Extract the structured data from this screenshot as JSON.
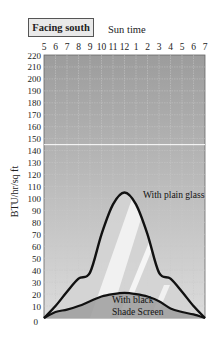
{
  "chart_data": {
    "type": "line",
    "title": "Facing south",
    "xlabel": "Sun time",
    "ylabel": "BTU/hr/sq ft",
    "x_ticks": [
      "5",
      "6",
      "7",
      "8",
      "9",
      "10",
      "11",
      "12",
      "1",
      "2",
      "3",
      "4",
      "5",
      "6",
      "7"
    ],
    "y_ticks": [
      0,
      10,
      20,
      30,
      40,
      50,
      60,
      70,
      80,
      90,
      100,
      110,
      120,
      130,
      140,
      150,
      160,
      170,
      180,
      190,
      200,
      210,
      220
    ],
    "ylim": [
      0,
      220
    ],
    "grid": true,
    "reference_line": {
      "y": 145,
      "color": "#ffffff"
    },
    "x": [
      "5",
      "6",
      "7",
      "8",
      "9",
      "10",
      "11",
      "12",
      "1",
      "2",
      "3",
      "4",
      "5",
      "6",
      "7"
    ],
    "series": [
      {
        "name": "With plain glass",
        "values": [
          0,
          10,
          22,
          33,
          38,
          70,
          95,
          105,
          95,
          70,
          38,
          33,
          22,
          10,
          0
        ]
      },
      {
        "name": "With black Shade Screen",
        "values": [
          0,
          5,
          7,
          10,
          14,
          18,
          20,
          21,
          20,
          18,
          14,
          8,
          5,
          3,
          0
        ]
      }
    ],
    "annotations": [
      "With plain glass",
      "With black Shade Screen"
    ]
  },
  "labels": {
    "title": "Facing south",
    "xlabel": "Sun time",
    "ylabel": "BTU/hr/sq ft",
    "plain_glass": "With plain glass",
    "shade_line1": "With black",
    "shade_line2": "Shade Screen"
  },
  "colors": {
    "plot_bg_top": "#9a9a9a",
    "plot_bg_bottom": "#d8d8d8",
    "curve": "#111111",
    "grid": "#c8c8c8"
  }
}
